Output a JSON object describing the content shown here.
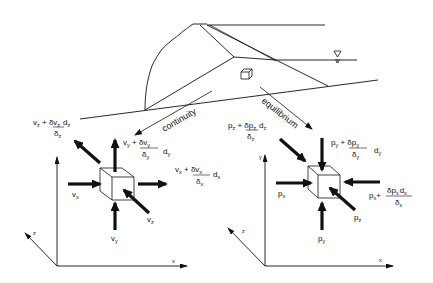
{
  "diagram": {
    "type": "dam-seepage-element-schematic",
    "flow_labels": {
      "continuity": "continuity",
      "equilibrium": "equilibrium"
    },
    "water_level_symbol": "▽",
    "left_element": {
      "title": "continuity",
      "axes": {
        "x": "x",
        "y": "",
        "z": "z"
      },
      "labels": {
        "vz_top": {
          "base": "v",
          "base_sub": "z",
          "plus": " + ",
          "num": "δv",
          "num_sub": "z",
          "den": "δ",
          "den_sub": "z",
          "d": "d",
          "d_sub": "z"
        },
        "vy_top": {
          "base": "v",
          "base_sub": "y",
          "plus": " + ",
          "num": "δv",
          "num_sub": "y",
          "den": "δ",
          "den_sub": "y",
          "d": "d",
          "d_sub": "y"
        },
        "vx_right": {
          "base": "v",
          "base_sub": "x",
          "plus": " + ",
          "num": "δv",
          "num_sub": "x",
          "den": "δ",
          "den_sub": "x",
          "d": "d",
          "d_sub": "x"
        },
        "vx": {
          "base": "v",
          "sub": "x"
        },
        "vy": {
          "base": "v",
          "sub": "y"
        },
        "vz": {
          "base": "v",
          "sub": "z"
        }
      }
    },
    "right_element": {
      "title": "equilibrium",
      "axes": {
        "x": "x",
        "y": "y",
        "z": "z"
      },
      "labels": {
        "pz_top": {
          "base": "p",
          "base_sub": "z",
          "plus": " + ",
          "num": "δp",
          "num_sub": "z",
          "den": "δ",
          "den_sub": "z",
          "d": "d",
          "d_sub": "z"
        },
        "py_top": {
          "base": "p",
          "base_sub": "y",
          "plus": " + ",
          "num": "δp",
          "num_sub": "y",
          "den": "δ",
          "den_sub": "y",
          "d": "d",
          "d_sub": "y"
        },
        "px_right": {
          "base": "p",
          "base_sub": "x",
          "plus": "+ ",
          "num": "δp",
          "num_sub": "x",
          "den": "δ",
          "den_sub": "x",
          "d": "d",
          "d_sub": "x"
        },
        "px": {
          "base": "p",
          "sub": "x"
        },
        "py": {
          "base": "p",
          "sub": "y"
        },
        "pz": {
          "base": "p",
          "sub": "z"
        }
      }
    },
    "colors": {
      "ink": "#111111",
      "background": "#ffffff"
    }
  }
}
